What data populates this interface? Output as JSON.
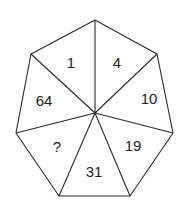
{
  "diagram": {
    "type": "heptagon-number-puzzle",
    "center": [
      95,
      113
    ],
    "vertices": [
      [
        95,
        20
      ],
      [
        157,
        54
      ],
      [
        173,
        133
      ],
      [
        130,
        196
      ],
      [
        59,
        196
      ],
      [
        16,
        133
      ],
      [
        31,
        54
      ]
    ],
    "sectors": [
      {
        "value": "1",
        "pos": [
          71,
          62
        ]
      },
      {
        "value": "4",
        "pos": [
          117,
          62
        ]
      },
      {
        "value": "10",
        "pos": [
          149,
          98
        ]
      },
      {
        "value": "19",
        "pos": [
          133,
          145
        ]
      },
      {
        "value": "31",
        "pos": [
          94,
          171
        ]
      },
      {
        "value": "?",
        "pos": [
          57,
          146
        ]
      },
      {
        "value": "64",
        "pos": [
          44,
          100
        ]
      }
    ],
    "line_color": "#2a2a2a",
    "text_color": "#222222"
  }
}
